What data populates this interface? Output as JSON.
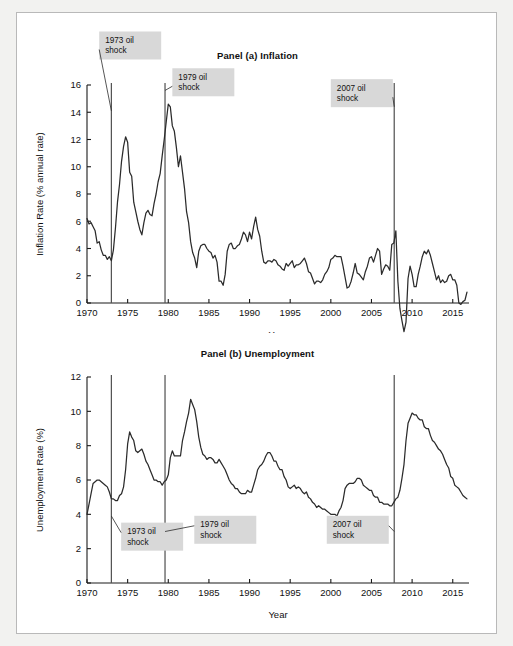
{
  "figure": {
    "x_axis_label": "Year",
    "shock_labels": [
      "1973 oil\nshock",
      "1979 oil\nshock",
      "2007 oil\nshock"
    ]
  },
  "chart_data": [
    {
      "type": "line",
      "title": "Panel (a) Inflation",
      "xlabel": "Year",
      "ylabel": "Inflation Rate (% annual rate)",
      "xlim": [
        1970,
        2017
      ],
      "ylim": [
        0,
        16
      ],
      "yticks": [
        0,
        2,
        4,
        6,
        8,
        10,
        12,
        14,
        16
      ],
      "xticks": [
        1970,
        1975,
        1980,
        1985,
        1990,
        1995,
        2000,
        2005,
        2010,
        2015
      ],
      "grid": false,
      "legend": "none",
      "annotations": [
        {
          "label": "1973 oil shock",
          "x": 1973.0,
          "box_x": 1971.5,
          "box_y": 18.9
        },
        {
          "label": "1979 oil shock",
          "x": 1979.6,
          "box_x": 1980.5,
          "box_y": 16.2
        },
        {
          "label": "2007 oil shock",
          "x": 2007.8,
          "box_x": 2000.0,
          "box_y": 15.4
        }
      ],
      "vlines": [
        1973.0,
        1979.6,
        2007.8
      ],
      "series": [
        {
          "name": "Inflation Rate (% annual rate)",
          "x": [
            1970.0,
            1970.25,
            1970.5,
            1970.75,
            1971.0,
            1971.25,
            1971.5,
            1971.75,
            1972.0,
            1972.25,
            1972.5,
            1972.75,
            1973.0,
            1973.25,
            1973.5,
            1973.75,
            1974.0,
            1974.25,
            1974.5,
            1974.75,
            1975.0,
            1975.25,
            1975.5,
            1975.75,
            1976.0,
            1976.25,
            1976.5,
            1976.75,
            1977.0,
            1977.25,
            1977.5,
            1977.75,
            1978.0,
            1978.25,
            1978.5,
            1978.75,
            1979.0,
            1979.25,
            1979.5,
            1979.75,
            1980.0,
            1980.25,
            1980.5,
            1980.75,
            1981.0,
            1981.25,
            1981.5,
            1981.75,
            1982.0,
            1982.25,
            1982.5,
            1982.75,
            1983.0,
            1983.25,
            1983.5,
            1983.75,
            1984.0,
            1984.25,
            1984.5,
            1984.75,
            1985.0,
            1985.25,
            1985.5,
            1985.75,
            1986.0,
            1986.25,
            1986.5,
            1986.75,
            1987.0,
            1987.25,
            1987.5,
            1987.75,
            1988.0,
            1988.25,
            1988.5,
            1988.75,
            1989.0,
            1989.25,
            1989.5,
            1989.75,
            1990.0,
            1990.25,
            1990.5,
            1990.75,
            1991.0,
            1991.25,
            1991.5,
            1991.75,
            1992.0,
            1992.25,
            1992.5,
            1992.75,
            1993.0,
            1993.25,
            1993.5,
            1993.75,
            1994.0,
            1994.25,
            1994.5,
            1994.75,
            1995.0,
            1995.25,
            1995.5,
            1995.75,
            1996.0,
            1996.25,
            1996.5,
            1996.75,
            1997.0,
            1997.25,
            1997.5,
            1997.75,
            1998.0,
            1998.25,
            1998.5,
            1998.75,
            1999.0,
            1999.25,
            1999.5,
            1999.75,
            2000.0,
            2000.25,
            2000.5,
            2000.75,
            2001.0,
            2001.25,
            2001.5,
            2001.75,
            2002.0,
            2002.25,
            2002.5,
            2002.75,
            2003.0,
            2003.25,
            2003.5,
            2003.75,
            2004.0,
            2004.25,
            2004.5,
            2004.75,
            2005.0,
            2005.25,
            2005.5,
            2005.75,
            2006.0,
            2006.25,
            2006.5,
            2006.75,
            2007.0,
            2007.25,
            2007.5,
            2007.75,
            2008.0,
            2008.25,
            2008.5,
            2008.75,
            2009.0,
            2009.25,
            2009.5,
            2009.75,
            2010.0,
            2010.25,
            2010.5,
            2010.75,
            2011.0,
            2011.25,
            2011.5,
            2011.75,
            2012.0,
            2012.25,
            2012.5,
            2012.75,
            2013.0,
            2013.25,
            2013.5,
            2013.75,
            2014.0,
            2014.25,
            2014.5,
            2014.75,
            2015.0,
            2015.25,
            2015.5,
            2015.75,
            2016.0,
            2016.25,
            2016.5,
            2016.75
          ],
          "y": [
            6.2,
            5.8,
            5.9,
            5.6,
            5.3,
            4.4,
            4.5,
            3.9,
            3.5,
            3.5,
            3.2,
            3.4,
            3.1,
            3.9,
            5.5,
            7.4,
            8.7,
            10.4,
            11.5,
            12.2,
            11.8,
            9.6,
            9.3,
            7.4,
            6.7,
            6.0,
            5.4,
            5.0,
            5.9,
            6.6,
            6.8,
            6.5,
            6.4,
            7.3,
            8.0,
            8.9,
            9.5,
            10.8,
            12.0,
            13.3,
            14.6,
            14.4,
            13.0,
            12.6,
            11.4,
            10.0,
            10.8,
            9.6,
            8.4,
            6.7,
            5.9,
            4.5,
            3.7,
            3.3,
            2.6,
            3.8,
            4.2,
            4.3,
            4.3,
            4.0,
            3.8,
            3.7,
            3.3,
            3.5,
            3.0,
            1.6,
            1.6,
            1.3,
            2.1,
            3.8,
            4.3,
            4.4,
            4.0,
            4.0,
            4.2,
            4.3,
            4.7,
            5.2,
            5.0,
            4.5,
            5.2,
            4.7,
            5.6,
            6.3,
            5.4,
            4.9,
            3.8,
            3.0,
            2.9,
            3.1,
            3.1,
            3.0,
            3.2,
            3.1,
            2.8,
            2.7,
            2.5,
            2.4,
            2.9,
            2.7,
            2.9,
            3.1,
            2.6,
            2.8,
            2.8,
            2.9,
            3.1,
            3.3,
            2.9,
            2.3,
            2.2,
            1.8,
            1.4,
            1.6,
            1.6,
            1.5,
            1.7,
            2.1,
            2.3,
            2.6,
            3.2,
            3.3,
            3.5,
            3.4,
            3.4,
            3.4,
            2.7,
            1.9,
            1.1,
            1.2,
            1.6,
            2.2,
            2.9,
            2.2,
            2.1,
            1.9,
            1.7,
            2.3,
            2.7,
            3.3,
            3.4,
            3.0,
            3.5,
            4.0,
            3.8,
            2.1,
            2.5,
            2.8,
            2.7,
            2.4,
            4.3,
            4.4,
            5.3,
            1.6,
            -0.4,
            -1.3,
            -2.1,
            -1.4,
            1.8,
            2.7,
            2.1,
            1.2,
            1.2,
            2.1,
            2.7,
            3.4,
            3.8,
            3.6,
            3.9,
            3.5,
            2.9,
            2.3,
            1.7,
            2.0,
            1.5,
            1.7,
            1.5,
            1.6,
            2.0,
            2.1,
            1.7,
            1.7,
            1.3,
            0.0,
            -0.1,
            0.1,
            0.2,
            0.8,
            1.1,
            1.1,
            1.5,
            2.2,
            2.9,
            2.5,
            1.9
          ]
        }
      ]
    },
    {
      "type": "line",
      "title": "Panel (b) Unemployment",
      "xlabel": "Year",
      "ylabel": "Unemployment Rate (%)",
      "xlim": [
        1970,
        2017
      ],
      "ylim": [
        0,
        12
      ],
      "yticks": [
        0,
        2,
        4,
        6,
        8,
        10,
        12
      ],
      "xticks": [
        1970,
        1975,
        1980,
        1985,
        1990,
        1995,
        2000,
        2005,
        2010,
        2015
      ],
      "grid": false,
      "legend": "none",
      "annotations": [
        {
          "label": "1973 oil shock",
          "x": 1973.0,
          "box_x": 1974.2,
          "box_y": 2.7
        },
        {
          "label": "1979 oil shock",
          "x": 1979.6,
          "box_x": 1983.2,
          "box_y": 3.1
        },
        {
          "label": "2007 oil shock",
          "x": 2007.8,
          "box_x": 1999.5,
          "box_y": 3.1
        }
      ],
      "vlines": [
        1973.0,
        1979.6,
        2007.8
      ],
      "series": [
        {
          "name": "Unemployment Rate (%)",
          "x": [
            1970.0,
            1970.25,
            1970.5,
            1970.75,
            1971.0,
            1971.25,
            1971.5,
            1971.75,
            1972.0,
            1972.25,
            1972.5,
            1972.75,
            1973.0,
            1973.25,
            1973.5,
            1973.75,
            1974.0,
            1974.25,
            1974.5,
            1974.75,
            1975.0,
            1975.25,
            1975.5,
            1975.75,
            1976.0,
            1976.25,
            1976.5,
            1976.75,
            1977.0,
            1977.25,
            1977.5,
            1977.75,
            1978.0,
            1978.25,
            1978.5,
            1978.75,
            1979.0,
            1979.25,
            1979.5,
            1979.75,
            1980.0,
            1980.25,
            1980.5,
            1980.75,
            1981.0,
            1981.25,
            1981.5,
            1981.75,
            1982.0,
            1982.25,
            1982.5,
            1982.75,
            1983.0,
            1983.25,
            1983.5,
            1983.75,
            1984.0,
            1984.25,
            1984.5,
            1984.75,
            1985.0,
            1985.25,
            1985.5,
            1985.75,
            1986.0,
            1986.25,
            1986.5,
            1986.75,
            1987.0,
            1987.25,
            1987.5,
            1987.75,
            1988.0,
            1988.25,
            1988.5,
            1988.75,
            1989.0,
            1989.25,
            1989.5,
            1989.75,
            1990.0,
            1990.25,
            1990.5,
            1990.75,
            1991.0,
            1991.25,
            1991.5,
            1991.75,
            1992.0,
            1992.25,
            1992.5,
            1992.75,
            1993.0,
            1993.25,
            1993.5,
            1993.75,
            1994.0,
            1994.25,
            1994.5,
            1994.75,
            1995.0,
            1995.25,
            1995.5,
            1995.75,
            1996.0,
            1996.25,
            1996.5,
            1996.75,
            1997.0,
            1997.25,
            1997.5,
            1997.75,
            1998.0,
            1998.25,
            1998.5,
            1998.75,
            1999.0,
            1999.25,
            1999.5,
            1999.75,
            2000.0,
            2000.25,
            2000.5,
            2000.75,
            2001.0,
            2001.25,
            2001.5,
            2001.75,
            2002.0,
            2002.25,
            2002.5,
            2002.75,
            2003.0,
            2003.25,
            2003.5,
            2003.75,
            2004.0,
            2004.25,
            2004.5,
            2004.75,
            2005.0,
            2005.25,
            2005.5,
            2005.75,
            2006.0,
            2006.25,
            2006.5,
            2006.75,
            2007.0,
            2007.25,
            2007.5,
            2007.75,
            2008.0,
            2008.25,
            2008.5,
            2008.75,
            2009.0,
            2009.25,
            2009.5,
            2009.75,
            2010.0,
            2010.25,
            2010.5,
            2010.75,
            2011.0,
            2011.25,
            2011.5,
            2011.75,
            2012.0,
            2012.25,
            2012.5,
            2012.75,
            2013.0,
            2013.25,
            2013.5,
            2013.75,
            2014.0,
            2014.25,
            2014.5,
            2014.75,
            2015.0,
            2015.25,
            2015.5,
            2015.75,
            2016.0,
            2016.25,
            2016.5,
            2016.75
          ],
          "y": [
            4.0,
            4.6,
            5.2,
            5.8,
            5.9,
            6.0,
            6.0,
            5.9,
            5.8,
            5.7,
            5.6,
            5.3,
            4.9,
            4.9,
            4.8,
            4.8,
            5.1,
            5.2,
            5.6,
            6.6,
            8.1,
            8.8,
            8.5,
            8.3,
            7.7,
            7.6,
            7.7,
            7.8,
            7.5,
            7.1,
            6.9,
            6.6,
            6.3,
            6.0,
            6.0,
            5.9,
            5.9,
            5.7,
            5.9,
            6.0,
            6.3,
            7.3,
            7.7,
            7.4,
            7.4,
            7.4,
            7.4,
            8.3,
            8.8,
            9.4,
            9.9,
            10.7,
            10.4,
            10.1,
            9.4,
            8.5,
            7.9,
            7.5,
            7.4,
            7.2,
            7.3,
            7.3,
            7.2,
            7.0,
            7.0,
            7.2,
            7.0,
            6.8,
            6.6,
            6.3,
            6.0,
            5.8,
            5.7,
            5.5,
            5.5,
            5.3,
            5.2,
            5.2,
            5.2,
            5.4,
            5.3,
            5.3,
            5.7,
            6.1,
            6.6,
            6.8,
            6.9,
            7.1,
            7.4,
            7.6,
            7.6,
            7.4,
            7.1,
            7.1,
            6.8,
            6.6,
            6.6,
            6.2,
            6.0,
            5.6,
            5.5,
            5.6,
            5.7,
            5.5,
            5.6,
            5.5,
            5.3,
            5.2,
            5.3,
            5.0,
            4.9,
            4.7,
            4.6,
            4.4,
            4.5,
            4.4,
            4.3,
            4.3,
            4.2,
            4.1,
            4.0,
            4.0,
            4.0,
            3.9,
            4.2,
            4.4,
            4.8,
            5.5,
            5.7,
            5.8,
            5.8,
            5.8,
            5.9,
            6.1,
            6.1,
            6.0,
            5.7,
            5.6,
            5.5,
            5.4,
            5.4,
            5.1,
            5.0,
            5.0,
            4.7,
            4.7,
            4.6,
            4.6,
            4.6,
            4.5,
            4.5,
            4.7,
            4.9,
            5.0,
            5.4,
            6.1,
            6.9,
            8.3,
            9.3,
            9.6,
            9.9,
            9.8,
            9.8,
            9.6,
            9.5,
            9.5,
            9.1,
            9.0,
            9.0,
            8.6,
            8.3,
            8.2,
            8.0,
            7.8,
            7.7,
            7.5,
            7.2,
            6.9,
            6.7,
            6.2,
            6.1,
            5.7,
            5.6,
            5.5,
            5.3,
            5.1,
            5.0,
            4.9,
            4.9,
            4.9,
            4.9,
            4.7,
            4.4
          ]
        }
      ]
    }
  ]
}
